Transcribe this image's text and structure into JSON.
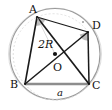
{
  "figure": {
    "type": "geometry-diagram",
    "background_color": "#ffffff",
    "stroke_color": "#1a1a1a",
    "faint_color": "#b9b9b9",
    "chord_color": "#8a8a8a",
    "angle_fill": "#b0b0b0",
    "circle": {
      "center_label": "O",
      "center_x": 55,
      "center_y": 54,
      "radius": 45
    },
    "vertices": [
      {
        "label": "A",
        "x": 37,
        "y": 17
      },
      {
        "label": "D",
        "x": 88,
        "y": 32
      },
      {
        "label": "C",
        "x": 89,
        "y": 84
      },
      {
        "label": "B",
        "x": 25,
        "y": 84
      }
    ],
    "labels": {
      "vertex_a": "A",
      "vertex_b": "B",
      "vertex_c": "C",
      "vertex_d": "D",
      "center": "O",
      "diameter": "2R",
      "chord": "a"
    },
    "segments": [
      {
        "name": "side-AB",
        "from": "A",
        "to": "B"
      },
      {
        "name": "side-BC",
        "from": "B",
        "to": "C"
      },
      {
        "name": "side-CD",
        "from": "C",
        "to": "D"
      },
      {
        "name": "side-DA",
        "from": "D",
        "to": "A"
      },
      {
        "name": "diagonal-AC",
        "from": "A",
        "to": "C"
      },
      {
        "name": "diagonal-BD",
        "from": "B",
        "to": "D"
      }
    ],
    "right_angle_markers": [
      {
        "at": "A",
        "between": [
          "B",
          "D"
        ]
      },
      {
        "at": "D",
        "between": [
          "A",
          "C"
        ]
      }
    ]
  }
}
